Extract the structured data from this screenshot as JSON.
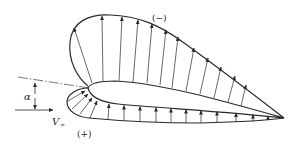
{
  "diagram": {
    "labels": {
      "suction_side": "(−)",
      "pressure_side": "(+)",
      "angle_of_attack": "α",
      "freestream_velocity": "V",
      "freestream_subscript": "∞"
    },
    "colors": {
      "stroke": "#2a2a2a",
      "background": "#ffffff"
    }
  }
}
